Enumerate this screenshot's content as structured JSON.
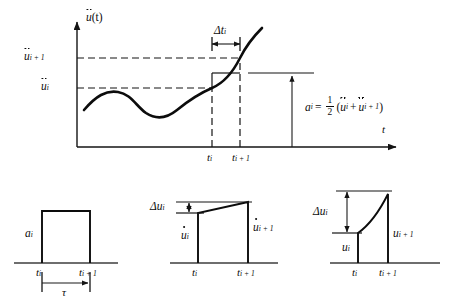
{
  "figure": {
    "type": "technical-diagram",
    "topic": "average-acceleration-integration-scheme",
    "main_plot": {
      "yaxis_label_base": "u",
      "yaxis_label_accent": "double-dot",
      "yaxis_label_suffix": "(t)",
      "xaxis_label": "t",
      "ytick_upper": "u",
      "ytick_upper_sub": "i + 1",
      "ytick_lower": "u",
      "ytick_lower_sub": "i",
      "xtick_left": "t",
      "xtick_left_sub": "i",
      "xtick_right": "t",
      "xtick_right_sub": "i + 1",
      "interval_label_delta": "Δt",
      "interval_label_sub": "i",
      "equation": {
        "lhs": "a",
        "lhs_sub": "i",
        "equals": "=",
        "numerator": "1",
        "denominator": "2",
        "open_paren": "(",
        "term1": "u",
        "term1_sub": "i",
        "plus": "+",
        "term2": "u",
        "term2_sub": "i + 1",
        "close_paren": ")"
      }
    },
    "panels": [
      {
        "name": "acceleration-pulse",
        "shape": "rectangle",
        "value_label": "a",
        "value_sub": "i",
        "accent": "none",
        "xtick_left": "t",
        "xtick_left_sub": "i",
        "xtick_right": "t",
        "xtick_right_sub": "i + 1",
        "duration_label": "τ"
      },
      {
        "name": "velocity-ramp",
        "shape": "trapezoid",
        "delta_label": "Δu",
        "delta_sub": "i",
        "accent": "single-dot",
        "left_label": "u",
        "left_sub": "i",
        "right_label": "u",
        "right_sub": "i + 1",
        "xtick_left": "t",
        "xtick_left_sub": "i",
        "xtick_right": "t",
        "xtick_right_sub": "i + 1"
      },
      {
        "name": "displacement-parabola",
        "shape": "parabolic",
        "delta_label": "Δu",
        "delta_sub": "i",
        "accent": "none",
        "left_label": "u",
        "left_sub": "i",
        "right_label": "u",
        "right_sub": "i + 1",
        "xtick_left": "t",
        "xtick_left_sub": "i",
        "xtick_right": "t",
        "xtick_right_sub": "i + 1"
      }
    ]
  },
  "colors": {
    "ink": "#0d0d0d",
    "baseline_gray": "#6e6e6e",
    "background": "#ffffff"
  }
}
